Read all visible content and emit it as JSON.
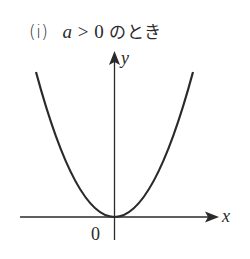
{
  "title": {
    "case_number": "(i)",
    "variable": "a",
    "relation": " > 0 ",
    "suffix": "のとき"
  },
  "axes": {
    "x_label": "x",
    "y_label": "y",
    "origin_label": "0"
  },
  "curve": {
    "type": "parabola",
    "opens": "upward",
    "vertex": "origin"
  },
  "colors": {
    "stroke": "#2a2a2a",
    "background": "#ffffff"
  }
}
